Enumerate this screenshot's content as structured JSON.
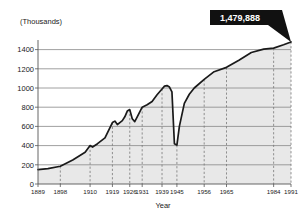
{
  "chart_data": {
    "type": "area",
    "title": "",
    "xlabel": "Year",
    "ylabel": "(Thousands)",
    "xlim": [
      1889,
      1991
    ],
    "ylim": [
      0,
      1500
    ],
    "grid": true,
    "legend": false,
    "y_ticks": [
      0,
      200,
      400,
      600,
      800,
      1000,
      1200,
      1400
    ],
    "x_ticks": [
      1889,
      1898,
      1910,
      1919,
      1926,
      1931,
      1939,
      1945,
      1956,
      1965,
      1984,
      1991
    ],
    "x_tick_labels": [
      "1889",
      "1898",
      "1910",
      "1919",
      "1926",
      "1931",
      "1939",
      "1945",
      "1956",
      "1965",
      "1984",
      "1991"
    ],
    "annotation": {
      "label": "1,479,888",
      "x": 1991,
      "y": 1480,
      "style": "black-callout-box"
    },
    "series": [
      {
        "name": "Employment (thousands)",
        "x": [
          1889,
          1893,
          1898,
          1903,
          1908,
          1910,
          1911,
          1913,
          1916,
          1919,
          1920,
          1921,
          1922,
          1923,
          1924,
          1925,
          1926,
          1927,
          1928,
          1929,
          1931,
          1933,
          1935,
          1937,
          1939,
          1940,
          1941,
          1942,
          1943,
          1944,
          1945,
          1946,
          1948,
          1950,
          1952,
          1956,
          1960,
          1965,
          1970,
          1975,
          1980,
          1984,
          1988,
          1991
        ],
        "values": [
          150,
          160,
          185,
          250,
          330,
          400,
          385,
          420,
          480,
          640,
          655,
          620,
          640,
          660,
          700,
          760,
          775,
          680,
          650,
          700,
          800,
          825,
          860,
          930,
          990,
          1020,
          1025,
          1010,
          960,
          420,
          405,
          600,
          840,
          935,
          1000,
          1090,
          1170,
          1215,
          1290,
          1370,
          1405,
          1415,
          1450,
          1480
        ]
      }
    ],
    "colors": {
      "line": "#1a1a1a",
      "fill": "#e8e8e8",
      "gridline": "#888888",
      "dashed_gridline": "#777777",
      "callout_bg": "#111111",
      "callout_text": "#ffffff",
      "axis": "#555555"
    }
  }
}
